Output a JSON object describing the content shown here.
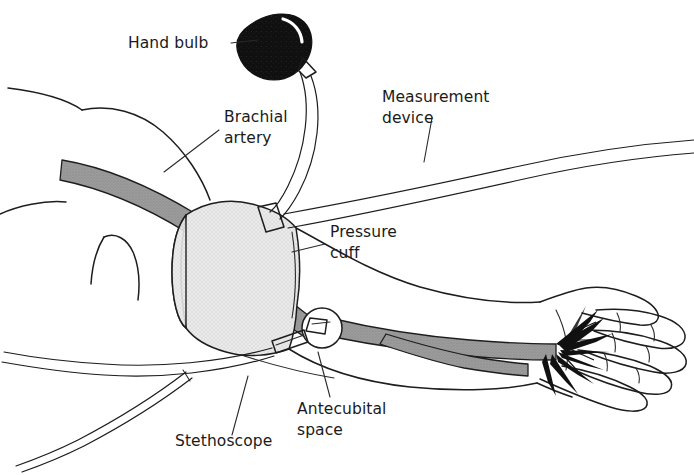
{
  "figure": {
    "background_color": "#ffffff",
    "line_color": "#1d1d1d",
    "width": 694,
    "height": 475
  },
  "palette": {
    "artery_gray": "#9a9a9a",
    "artery_gray_dark": "#7a7a7a",
    "cuff_gray": "#e6e6e6",
    "cuff_gray_shadow": "#d2d2d2",
    "bulb_black": "#121212",
    "outline": "#1d1d1d",
    "text": "#1a1a1a",
    "white": "#ffffff"
  },
  "labels": [
    {
      "id": "hand-bulb",
      "lines": [
        "Hand bulb"
      ],
      "x": 128,
      "y": 48,
      "anchor": "start"
    },
    {
      "id": "brachial-artery",
      "lines": [
        "Brachial",
        "artery"
      ],
      "x": 224,
      "y": 122,
      "anchor": "start"
    },
    {
      "id": "measurement-device",
      "lines": [
        "Measurement",
        "device"
      ],
      "x": 382,
      "y": 102,
      "anchor": "start"
    },
    {
      "id": "pressure-cuff",
      "lines": [
        "Pressure",
        "cuff"
      ],
      "x": 330,
      "y": 237,
      "anchor": "start"
    },
    {
      "id": "antecubital-space",
      "lines": [
        "Antecubital",
        "space"
      ],
      "x": 297,
      "y": 414,
      "anchor": "start"
    },
    {
      "id": "stethoscope",
      "lines": [
        "Stethoscope"
      ],
      "x": 175,
      "y": 446,
      "anchor": "start"
    }
  ],
  "parts": {
    "hand_bulb": "hand-bulb-shape",
    "pressure_cuff": "pressure-cuff-shape",
    "brachial_artery": "brachial-artery-shape",
    "stethoscope_chestpiece": "stethoscope-chestpiece-shape",
    "stethoscope_tubing": "stethoscope-tubing-shape",
    "measurement_tubing": "measurement-device-tubing-shape",
    "arm": "arm-outline-shape",
    "hand": "hand-outline-shape",
    "palmar_arch": "palmar-arterial-branches"
  }
}
